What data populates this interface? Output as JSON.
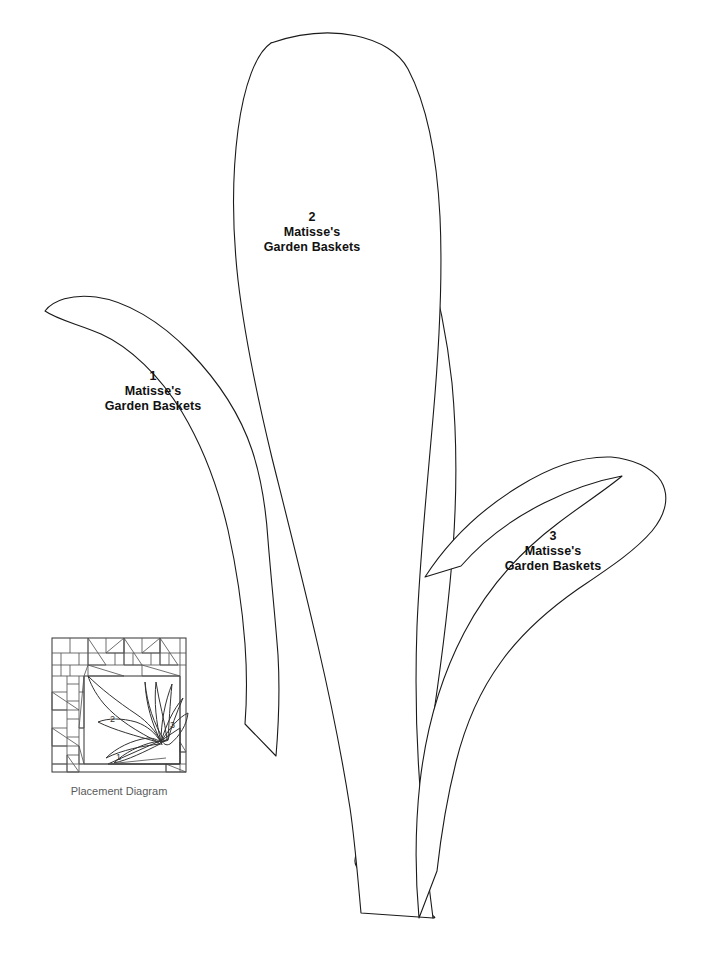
{
  "sheet": {
    "width": 702,
    "height": 953,
    "background_color": "#ffffff",
    "line_color": "#1a1a1a"
  },
  "pattern_name": "Matisse's Garden Baskets",
  "pieces": [
    {
      "number": "1",
      "name_line_1": "Matisse's",
      "name_line_2": "Garden Baskets",
      "shape": "curved-leaf-left"
    },
    {
      "number": "2",
      "name_line_1": "Matisse's",
      "name_line_2": "Garden Baskets",
      "shape": "tall-center-leaf"
    },
    {
      "number": "3",
      "name_line_1": "Matisse's",
      "name_line_2": "Garden Baskets",
      "shape": "curved-leaf-right"
    }
  ],
  "placement_diagram": {
    "caption": "Placement Diagram",
    "caption_color": "#5a5a5a",
    "line_color": "#555555",
    "leaf_markers": [
      "1",
      "2",
      "3"
    ],
    "description": "Square quilt block with pieced brick-and-triangle border surrounding an appliqued leaf spray"
  }
}
